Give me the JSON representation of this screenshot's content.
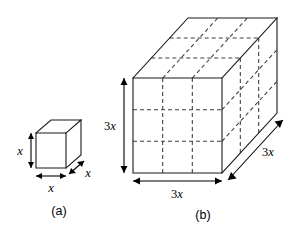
{
  "figure": {
    "background_color": "#ffffff",
    "line_color": "#1a1a1a",
    "dashed_color": "#3c3c3c",
    "panels": [
      {
        "id": "a",
        "caption": "(a)",
        "shape": "cube",
        "divisions": 1,
        "labels": {
          "height": "x",
          "width": "x",
          "depth": "x"
        }
      },
      {
        "id": "b",
        "caption": "(b)",
        "shape": "cube",
        "divisions": 3,
        "labels": {
          "height": "3x",
          "width": "3x",
          "depth": "3x"
        }
      }
    ]
  },
  "small_cube": {
    "caption": "(a)",
    "height_label_prefix": "",
    "height_label_var": "x",
    "width_label_prefix": "",
    "width_label_var": "x",
    "depth_label_prefix": "",
    "depth_label_var": "x"
  },
  "large_cube": {
    "caption": "(b)",
    "height_label_prefix": "3",
    "height_label_var": "x",
    "width_label_prefix": "3",
    "width_label_var": "x",
    "depth_label_prefix": "3",
    "depth_label_var": "x"
  }
}
